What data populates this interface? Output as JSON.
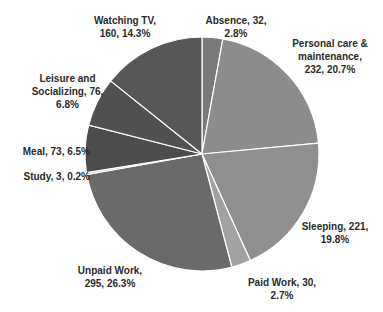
{
  "chart_data": {
    "type": "pie",
    "title": "",
    "start_angle_deg": 0,
    "direction": "clockwise",
    "categories": [
      "Absence",
      "Personal care & maintenance",
      "Sleeping",
      "Paid Work",
      "Unpaid Work",
      "Study",
      "Meal",
      "Leisure and Socializing",
      "Watching TV"
    ],
    "values": [
      32,
      232,
      221,
      30,
      295,
      3,
      73,
      76,
      160
    ],
    "percentages": [
      2.8,
      20.7,
      19.8,
      2.7,
      26.3,
      0.2,
      6.5,
      6.8,
      14.3
    ],
    "colors": [
      "#7a7a7a",
      "#8c8c8c",
      "#8f8f8f",
      "#a2a2a2",
      "#6a6a6a",
      "#b5b5b5",
      "#4c4c4c",
      "#515151",
      "#575757"
    ],
    "data_labels": true,
    "legend": "none"
  },
  "labels": {
    "absence": "Absence, 32,\n2.8%",
    "personal": "Personal care &\nmaintenance,\n232, 20.7%",
    "sleeping": "Sleeping, 221,\n19.8%",
    "paid": "Paid Work, 30,\n2.7%",
    "unpaid": "Unpaid Work,\n295, 26.3%",
    "study": "Study, 3, 0.2%",
    "meal": "Meal, 73, 6.5%",
    "leisure": "Leisure and\nSocializing, 76,\n6.8%",
    "tv": "Watching TV,\n160, 14.3%"
  }
}
